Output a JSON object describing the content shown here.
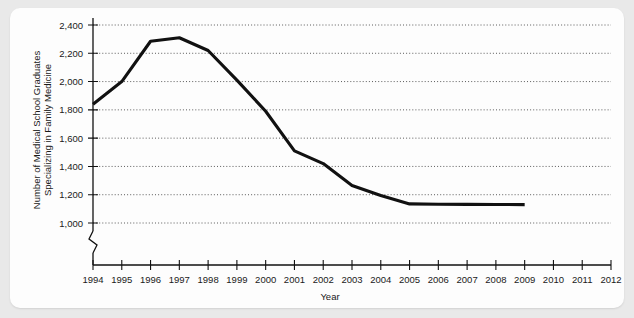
{
  "chart_data": {
    "type": "line",
    "title": "",
    "xlabel": "Year",
    "ylabel": "Number of Medical School Graduates Specializing in Family Medicine",
    "ylabel_line1": "Number of Medical School Graduates",
    "ylabel_line2": "Specializing in Family Medicine",
    "x": [
      1994,
      1995,
      1996,
      1997,
      1998,
      1999,
      2000,
      2001,
      2002,
      2003,
      2004,
      2005,
      2006,
      2007,
      2008,
      2009
    ],
    "values": [
      1840,
      2000,
      2285,
      2310,
      2220,
      2010,
      1790,
      1510,
      1420,
      1265,
      1195,
      1135,
      1133,
      1132,
      1131,
      1130
    ],
    "series": [
      {
        "name": "Family Medicine Graduates",
        "values": [
          1840,
          2000,
          2285,
          2310,
          2220,
          2010,
          1790,
          1510,
          1420,
          1265,
          1195,
          1135,
          1133,
          1132,
          1131,
          1130
        ]
      }
    ],
    "x_ticks": [
      "1994",
      "1995",
      "1996",
      "1997",
      "1998",
      "1999",
      "2000",
      "2001",
      "2002",
      "2003",
      "2004",
      "2005",
      "2006",
      "2007",
      "2008",
      "2009",
      "2010",
      "2011",
      "2012"
    ],
    "x_tick_values": [
      1994,
      1995,
      1996,
      1997,
      1998,
      1999,
      2000,
      2001,
      2002,
      2003,
      2004,
      2005,
      2006,
      2007,
      2008,
      2009,
      2010,
      2011,
      2012
    ],
    "y_ticks": [
      "1,000",
      "1,200",
      "1,400",
      "1,600",
      "1,800",
      "2,000",
      "2,200",
      "2,400"
    ],
    "y_tick_values": [
      1000,
      1200,
      1400,
      1600,
      1800,
      2000,
      2200,
      2400
    ],
    "ylim": [
      1000,
      2400
    ],
    "xlim": [
      1994,
      2012
    ],
    "grid": true,
    "grid_style": "dotted-horizontal",
    "y_axis_break": true,
    "legend": "none",
    "line_color": "#111111",
    "grid_color": "#4a4a4a",
    "background_color": "#fdfdfd",
    "page_background_color": "#e9e9e9"
  }
}
